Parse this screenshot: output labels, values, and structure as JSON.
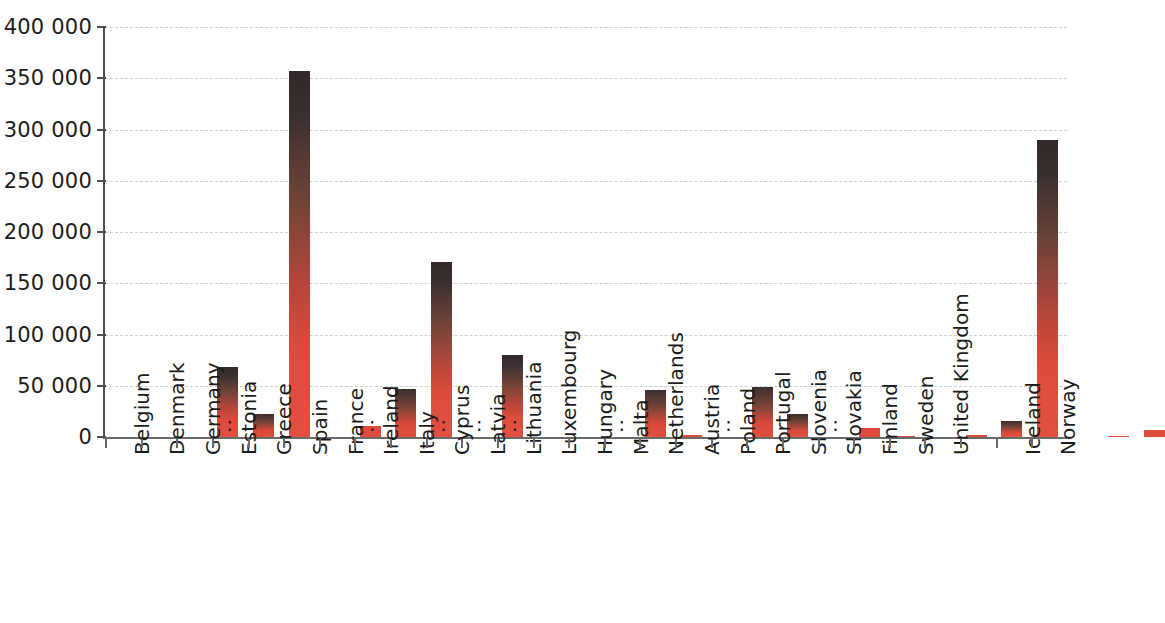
{
  "chart_data": {
    "type": "bar",
    "title": "",
    "subtitle": "",
    "xlabel": "",
    "ylabel": "",
    "ylim": [
      0,
      400000
    ],
    "grid": true,
    "legend": null,
    "y_tick_labels": [
      "0",
      "50 000",
      "100 000",
      "150 000",
      "200 000",
      "250 000",
      "300 000",
      "350 000",
      "400 000"
    ],
    "y_tick_values": [
      0,
      50000,
      100000,
      150000,
      200000,
      250000,
      300000,
      350000,
      400000
    ],
    "not_available_symbol": ":",
    "colors": {
      "bar_red": "#e04a3c",
      "bar_dark_top": "#33292a",
      "gridline": "#cfcfcf",
      "axis": "#4d4d4d",
      "text": "#1c1c1c",
      "background": "#ffffff"
    },
    "categories": [
      "Belgium",
      "Denmark",
      "Germany",
      "Estonia",
      "Greece",
      "Spain",
      "France",
      "Ireland",
      "Italy",
      "Cyprus",
      "Latvia",
      "Lithuania",
      "Luxembourg",
      "Hungary",
      "Malta",
      "Netherlands",
      "Austria",
      "Poland",
      "Portugal",
      "Slovenia",
      "Slovakia",
      "Finland",
      "Sweden",
      "United Kingdom",
      "",
      "Iceland",
      "Norway"
    ],
    "values": [
      68000,
      22000,
      357000,
      null,
      11000,
      47000,
      171000,
      null,
      80000,
      null,
      null,
      null,
      46000,
      2000,
      null,
      49000,
      22000,
      null,
      9000,
      600,
      null,
      2000,
      16000,
      290000,
      null,
      1000,
      7000
    ],
    "points": [
      {
        "label": "Belgium",
        "value": 68000,
        "available": true
      },
      {
        "label": "Denmark",
        "value": 22000,
        "available": true
      },
      {
        "label": "Germany",
        "value": 357000,
        "available": true
      },
      {
        "label": "Estonia",
        "value": null,
        "available": false
      },
      {
        "label": "Greece",
        "value": 11000,
        "available": true
      },
      {
        "label": "Spain",
        "value": 47000,
        "available": true
      },
      {
        "label": "France",
        "value": 171000,
        "available": true
      },
      {
        "label": "Ireland",
        "value": null,
        "available": false
      },
      {
        "label": "Italy",
        "value": 80000,
        "available": true
      },
      {
        "label": "Cyprus",
        "value": null,
        "available": false
      },
      {
        "label": "Latvia",
        "value": null,
        "available": false
      },
      {
        "label": "Lithuania",
        "value": null,
        "available": false
      },
      {
        "label": "Luxembourg",
        "value": 46000,
        "available": true
      },
      {
        "label": "Hungary",
        "value": 2000,
        "available": true
      },
      {
        "label": "Malta",
        "value": null,
        "available": false
      },
      {
        "label": "Netherlands",
        "value": 49000,
        "available": true
      },
      {
        "label": "Austria",
        "value": 22000,
        "available": true
      },
      {
        "label": "Poland",
        "value": null,
        "available": false
      },
      {
        "label": "Portugal",
        "value": 9000,
        "available": true
      },
      {
        "label": "Slovenia",
        "value": 600,
        "available": true
      },
      {
        "label": "Slovakia",
        "value": null,
        "available": false
      },
      {
        "label": "Finland",
        "value": 2000,
        "available": true
      },
      {
        "label": "Sweden",
        "value": 16000,
        "available": true
      },
      {
        "label": "United Kingdom",
        "value": 290000,
        "available": true
      },
      {
        "label": "",
        "value": null,
        "available": false,
        "spacer": true
      },
      {
        "label": "Iceland",
        "value": 1000,
        "available": true
      },
      {
        "label": "Norway",
        "value": 7000,
        "available": true
      }
    ]
  }
}
